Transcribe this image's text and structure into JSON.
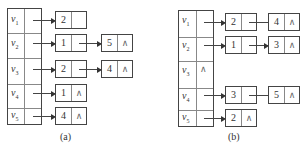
{
  "figures": [
    {
      "id": "a",
      "caption": "(a)",
      "vertices": [
        {
          "label": "v",
          "sub": "1",
          "list": [
            {
              "value": "2",
              "next": ""
            }
          ]
        },
        {
          "label": "v",
          "sub": "2",
          "list": [
            {
              "value": "1",
              "next": ""
            },
            {
              "value": "5",
              "next": "∧"
            }
          ]
        },
        {
          "label": "v",
          "sub": "3",
          "list": [
            {
              "value": "2",
              "next": ""
            },
            {
              "value": "4",
              "next": "∧"
            }
          ]
        },
        {
          "label": "v",
          "sub": "4",
          "list": [
            {
              "value": "1",
              "next": "∧"
            }
          ]
        },
        {
          "label": "v",
          "sub": "5",
          "list": [
            {
              "value": "4",
              "next": "∧"
            }
          ]
        }
      ]
    },
    {
      "id": "b",
      "caption": "(b)",
      "vertices": [
        {
          "label": "v",
          "sub": "1",
          "list": [
            {
              "value": "2",
              "next": ""
            },
            {
              "value": "4",
              "next": "∧"
            }
          ]
        },
        {
          "label": "v",
          "sub": "2",
          "list": [
            {
              "value": "1",
              "next": ""
            },
            {
              "value": "3",
              "next": "∧"
            }
          ]
        },
        {
          "label": "v",
          "sub": "3",
          "nil": "∧",
          "list": []
        },
        {
          "label": "v",
          "sub": "4",
          "list": [
            {
              "value": "3",
              "next": ""
            },
            {
              "value": "5",
              "next": "∧"
            }
          ]
        },
        {
          "label": "v",
          "sub": "5",
          "list": [
            {
              "value": "2",
              "next": "∧"
            }
          ]
        }
      ]
    }
  ]
}
